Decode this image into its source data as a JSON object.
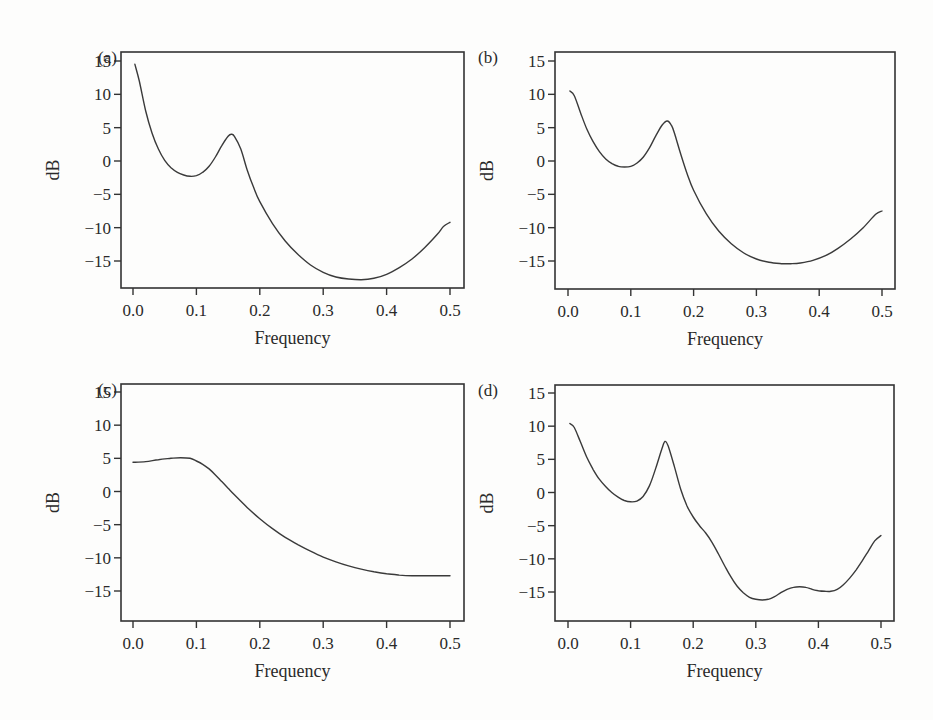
{
  "chart_data": [
    {
      "type": "line",
      "panel_label": "(a)",
      "title": "",
      "xlabel": "Frequency",
      "ylabel": "dB",
      "xlim": [
        0.0,
        0.5
      ],
      "ylim": [
        -19.5,
        16.5
      ],
      "xticks": [
        "0.0",
        "0.1",
        "0.2",
        "0.3",
        "0.4",
        "0.5"
      ],
      "yticks": [
        "15",
        "10",
        "5",
        "0",
        "−5",
        "−10",
        "−15"
      ],
      "grid": false,
      "x": [
        0.003,
        0.01,
        0.02,
        0.03,
        0.04,
        0.05,
        0.06,
        0.07,
        0.08,
        0.09,
        0.1,
        0.11,
        0.12,
        0.13,
        0.14,
        0.15,
        0.155,
        0.16,
        0.17,
        0.18,
        0.19,
        0.2,
        0.22,
        0.24,
        0.26,
        0.28,
        0.3,
        0.32,
        0.34,
        0.36,
        0.38,
        0.4,
        0.42,
        0.44,
        0.46,
        0.48,
        0.49,
        0.5
      ],
      "y": [
        14.5,
        12.0,
        7.5,
        4.2,
        1.8,
        0.1,
        -1.0,
        -1.7,
        -2.1,
        -2.3,
        -2.2,
        -1.7,
        -0.8,
        0.6,
        2.3,
        3.7,
        4.0,
        3.7,
        1.8,
        -1.3,
        -3.9,
        -6.1,
        -9.4,
        -12.0,
        -14.0,
        -15.6,
        -16.7,
        -17.4,
        -17.7,
        -17.8,
        -17.6,
        -17.0,
        -16.0,
        -14.7,
        -13.0,
        -11.0,
        -9.8,
        -9.2
      ]
    },
    {
      "type": "line",
      "panel_label": "(b)",
      "title": "",
      "xlabel": "Frequency",
      "ylabel": "dB",
      "xlim": [
        0.0,
        0.5
      ],
      "ylim": [
        -19.5,
        16.5
      ],
      "xticks": [
        "0.0",
        "0.1",
        "0.2",
        "0.3",
        "0.4",
        "0.5"
      ],
      "yticks": [
        "15",
        "10",
        "5",
        "0",
        "−5",
        "−10",
        "−15"
      ],
      "grid": false,
      "x": [
        0.003,
        0.01,
        0.02,
        0.03,
        0.04,
        0.05,
        0.06,
        0.07,
        0.08,
        0.09,
        0.1,
        0.11,
        0.12,
        0.13,
        0.14,
        0.15,
        0.158,
        0.165,
        0.17,
        0.18,
        0.19,
        0.2,
        0.22,
        0.24,
        0.26,
        0.28,
        0.3,
        0.32,
        0.34,
        0.355,
        0.37,
        0.39,
        0.41,
        0.43,
        0.45,
        0.47,
        0.49,
        0.5
      ],
      "y": [
        10.5,
        9.8,
        7.2,
        4.8,
        2.9,
        1.4,
        0.3,
        -0.4,
        -0.8,
        -0.9,
        -0.8,
        -0.3,
        0.6,
        2.0,
        3.8,
        5.4,
        6.0,
        5.3,
        4.0,
        0.9,
        -2.0,
        -4.4,
        -7.9,
        -10.5,
        -12.4,
        -13.8,
        -14.7,
        -15.2,
        -15.4,
        -15.4,
        -15.3,
        -14.9,
        -14.2,
        -13.1,
        -11.7,
        -10.0,
        -8.0,
        -7.5
      ]
    },
    {
      "type": "line",
      "panel_label": "(c)",
      "title": "",
      "xlabel": "Frequency",
      "ylabel": "dB",
      "xlim": [
        0.0,
        0.5
      ],
      "ylim": [
        -19.5,
        16.5
      ],
      "xticks": [
        "0.0",
        "0.1",
        "0.2",
        "0.3",
        "0.4",
        "0.5"
      ],
      "yticks": [
        "15",
        "10",
        "5",
        "0",
        "−5",
        "−10",
        "−15"
      ],
      "grid": false,
      "x": [
        0.0,
        0.02,
        0.04,
        0.06,
        0.075,
        0.09,
        0.1,
        0.11,
        0.12,
        0.13,
        0.14,
        0.15,
        0.16,
        0.18,
        0.2,
        0.22,
        0.24,
        0.26,
        0.28,
        0.3,
        0.32,
        0.34,
        0.36,
        0.38,
        0.4,
        0.42,
        0.44,
        0.46,
        0.48,
        0.5
      ],
      "y": [
        4.4,
        4.5,
        4.8,
        5.0,
        5.1,
        5.0,
        4.6,
        4.1,
        3.4,
        2.5,
        1.5,
        0.5,
        -0.5,
        -2.4,
        -4.1,
        -5.6,
        -6.9,
        -8.0,
        -9.0,
        -9.9,
        -10.6,
        -11.2,
        -11.7,
        -12.1,
        -12.4,
        -12.6,
        -12.7,
        -12.7,
        -12.7,
        -12.7
      ]
    },
    {
      "type": "line",
      "panel_label": "(d)",
      "title": "",
      "xlabel": "Frequency",
      "ylabel": "dB",
      "xlim": [
        0.0,
        0.5
      ],
      "ylim": [
        -19.5,
        16.5
      ],
      "xticks": [
        "0.0",
        "0.1",
        "0.2",
        "0.3",
        "0.4",
        "0.5"
      ],
      "yticks": [
        "15",
        "10",
        "5",
        "0",
        "−5",
        "−10",
        "−15"
      ],
      "grid": false,
      "x": [
        0.003,
        0.01,
        0.02,
        0.03,
        0.04,
        0.05,
        0.06,
        0.07,
        0.08,
        0.09,
        0.1,
        0.11,
        0.12,
        0.13,
        0.14,
        0.15,
        0.155,
        0.16,
        0.17,
        0.18,
        0.19,
        0.2,
        0.21,
        0.22,
        0.23,
        0.24,
        0.25,
        0.26,
        0.27,
        0.28,
        0.29,
        0.3,
        0.31,
        0.32,
        0.33,
        0.34,
        0.35,
        0.36,
        0.37,
        0.38,
        0.39,
        0.4,
        0.41,
        0.42,
        0.43,
        0.44,
        0.45,
        0.46,
        0.47,
        0.48,
        0.49,
        0.5
      ],
      "y": [
        10.4,
        9.8,
        7.6,
        5.3,
        3.5,
        2.0,
        0.9,
        0.0,
        -0.7,
        -1.2,
        -1.4,
        -1.3,
        -0.6,
        1.0,
        3.6,
        6.6,
        7.7,
        7.0,
        3.9,
        0.5,
        -2.0,
        -3.7,
        -5.0,
        -6.1,
        -7.5,
        -9.2,
        -11.0,
        -12.7,
        -14.1,
        -15.1,
        -15.8,
        -16.1,
        -16.2,
        -16.1,
        -15.7,
        -15.1,
        -14.6,
        -14.3,
        -14.2,
        -14.3,
        -14.6,
        -14.8,
        -14.9,
        -14.9,
        -14.6,
        -13.9,
        -12.9,
        -11.7,
        -10.3,
        -8.8,
        -7.3,
        -6.5
      ]
    }
  ]
}
